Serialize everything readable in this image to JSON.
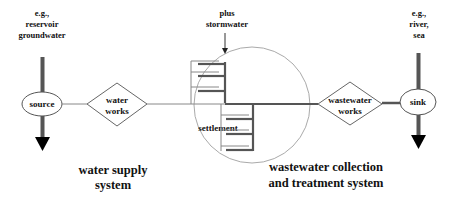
{
  "diagram": {
    "type": "flow",
    "colors": {
      "line": "#555555",
      "thin_line": "#888888",
      "circle": "#aaaaaa",
      "text": "#111111",
      "background": "#ffffff"
    },
    "source_annotation": [
      "e.g.,",
      "reservoir",
      "groundwater"
    ],
    "sink_annotation": [
      "e.g.,",
      "river,",
      "sea"
    ],
    "stormwater_annotation": [
      "plus",
      "stormwater"
    ],
    "nodes": {
      "source": {
        "label": "source",
        "shape": "ellipse"
      },
      "water_works": {
        "label_lines": [
          "water",
          "works"
        ],
        "shape": "diamond"
      },
      "settlement": {
        "label": "settlement",
        "shape": "circle"
      },
      "wastewater_works": {
        "label_lines": [
          "wastewater",
          "works"
        ],
        "shape": "diamond"
      },
      "sink": {
        "label": "sink",
        "shape": "ellipse"
      }
    },
    "system_labels": {
      "water_supply": [
        "water supply",
        "system"
      ],
      "wastewater": [
        "wastewater collection",
        "and treatment system"
      ]
    },
    "edges": [
      {
        "from": "source",
        "to": "water_works"
      },
      {
        "from": "water_works",
        "to": "settlement"
      },
      {
        "from": "settlement",
        "to": "wastewater_works"
      },
      {
        "from": "wastewater_works",
        "to": "sink"
      }
    ]
  }
}
